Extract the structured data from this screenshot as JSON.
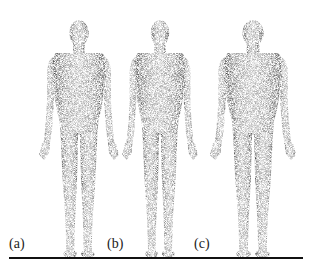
{
  "figure": {
    "panels": [
      {
        "label": "(a)",
        "description": "stippled human body model, front view, slim build"
      },
      {
        "label": "(b)",
        "description": "stippled human body model, front view, slender build"
      },
      {
        "label": "(c)",
        "description": "stippled human body model, front view, broader build"
      }
    ],
    "colors": {
      "ink": "#222222",
      "background": "#ffffff",
      "ground_line": "#111111"
    }
  }
}
